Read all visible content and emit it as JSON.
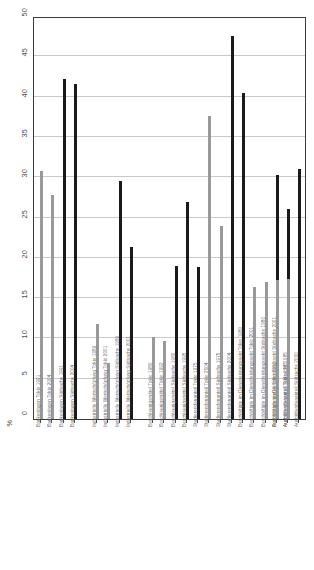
{
  "chart_data": {
    "type": "bar",
    "title": "",
    "xlabel": "",
    "ylabel": "%",
    "ylim": [
      0,
      50
    ],
    "ytick_labels": [
      "0",
      "5",
      "10",
      "15",
      "20",
      "25",
      "30",
      "35",
      "40",
      "45",
      "50"
    ],
    "ytick_values": [
      0,
      5,
      10,
      15,
      20,
      25,
      30,
      35,
      40,
      45,
      50
    ],
    "grid": true,
    "legend_position": "none",
    "axis_unit_symbol": "%",
    "categories": [
      "Bankenlagen Tokio 1991",
      "Bankenlagen Tokio 2004",
      "Bankenlagen Südsachs 1991",
      "Bankenlagen Südsachs 2004",
      "Industrielle Wertschöpfung Tokio 1989",
      "Industrielle Wertschöpfung Tokio 2001",
      "Industrielle Wertschöpfung Südsachs 1989",
      "Industrielle Wertschöpfung Südsachs 2001",
      "Beschleunigsmittel Tokio 1980",
      "Beschleunigsmittel Tokio 1992",
      "Beschleunigsmittel Südsachs 1980",
      "Beschleunigsmittel Südsachs 1995",
      "Studierendenanteil Tokio 1975",
      "Studierendenanteil Tokio 2004",
      "Studierendenanteil Südsachs 1975",
      "Studierendenanteil Südsachs 2004",
      "Beschäftigte im Dienstleistungssekt Tokio 1980",
      "Beschäftigte im Dienstleistungssekt Tokio 2001",
      "Beschäftigte im Dienstleistungssekt Südsachs 1980",
      "Beschäftigte im Dienstleistungssekt Südsachs 2001",
      "Ausbildendenanteil Tokio 1985",
      "Ausbildendenanteil Tokio 2000",
      "Ausbildendenanteil Südsachs 1985",
      "Ausbildendenanteil Südsachs 2000"
    ],
    "values": [
      30.8,
      27.8,
      42.2,
      41.6,
      11.8,
      6.9,
      29.5,
      21.4,
      10.2,
      9.7,
      19.0,
      26.9,
      18.9,
      37.6,
      23.9,
      47.5,
      40.5,
      16.4,
      17.0,
      30.3,
      26.0,
      17.2,
      17.4,
      31.0
    ],
    "bar_colors": [
      "gray",
      "gray",
      "black",
      "black",
      "gray",
      "gray",
      "black",
      "black",
      "gray",
      "gray",
      "black",
      "black",
      "black",
      "gray",
      "gray",
      "black",
      "black",
      "gray",
      "gray",
      "black",
      "black",
      "gray",
      "gray",
      "black"
    ],
    "bar_x_positions": [
      6,
      17,
      29,
      40,
      62,
      73,
      85,
      96,
      118,
      129,
      141,
      152,
      163,
      174,
      186,
      197,
      208,
      219,
      231,
      242,
      253,
      242,
      253,
      264
    ],
    "colors": {
      "gray_series": "#999999",
      "black_series": "#1a1a1a",
      "gridline": "#c9c9c9",
      "axis": "#3a3a3a",
      "tick_text": "#4a4a4a",
      "label_text": "#6b6b6b"
    }
  }
}
